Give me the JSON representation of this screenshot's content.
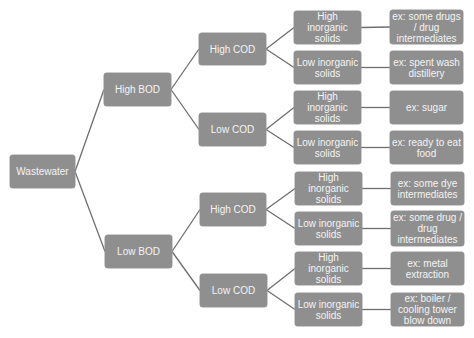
{
  "diagram": {
    "colors": {
      "node_fill": "#8f8f8f",
      "node_text": "#f4f4f4",
      "connector": "#6e6e6e"
    },
    "root": {
      "label": "Wastewater"
    },
    "bod": [
      {
        "label": "High BOD"
      },
      {
        "label": "Low BOD"
      }
    ],
    "cod": [
      {
        "label": "High COD"
      },
      {
        "label": "Low COD"
      },
      {
        "label": "High COD"
      },
      {
        "label": "Low COD"
      }
    ],
    "solids": [
      {
        "label": "High inorganic solids"
      },
      {
        "label": "Low inorganic solids"
      },
      {
        "label": "High inorganic solids"
      },
      {
        "label": "Low inorganic solids"
      },
      {
        "label": "High inorganic solids"
      },
      {
        "label": "Low inorganic solids"
      },
      {
        "label": "High inorganic solids"
      },
      {
        "label": "Low inorganic solids"
      }
    ],
    "examples": [
      {
        "label": "ex: some drugs / drug intermediates"
      },
      {
        "label": "ex: spent wash distillery"
      },
      {
        "label": "ex: sugar"
      },
      {
        "label": "ex: ready to eat food"
      },
      {
        "label": "ex: some dye intermediates"
      },
      {
        "label": "ex: some drug / drug intermediates"
      },
      {
        "label": "ex: metal extraction"
      },
      {
        "label": "ex: boiler / cooling tower blow down"
      }
    ]
  }
}
